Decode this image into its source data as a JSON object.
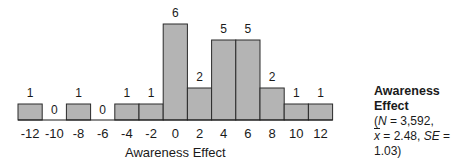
{
  "chart_data": {
    "type": "bar",
    "title": "Awareness Effect",
    "xlabel": "Awareness Effect",
    "ylabel": "",
    "categories": [
      "-12",
      "-10",
      "-8",
      "-6",
      "-4",
      "-2",
      "0",
      "2",
      "4",
      "6",
      "8",
      "10",
      "12"
    ],
    "values": [
      1,
      0,
      1,
      0,
      1,
      1,
      6,
      2,
      5,
      5,
      2,
      1,
      1
    ],
    "ylim": [
      0,
      6
    ],
    "grid": false,
    "data_labels": true,
    "legend_position": "right",
    "annotation": {
      "title": "Awareness Effect",
      "N": "3,592",
      "mean": "2.48",
      "SE": "1.03"
    }
  },
  "legend": {
    "title": "Awareness Effect",
    "n_label": "N",
    "n_value": "3,592",
    "mean_symbol": "x",
    "mean_value": "2.48",
    "se_label": "SE",
    "se_value": "1.03"
  },
  "colors": {
    "bar_fill": "#b4b4b4",
    "bar_stroke": "#2a2a2a"
  }
}
